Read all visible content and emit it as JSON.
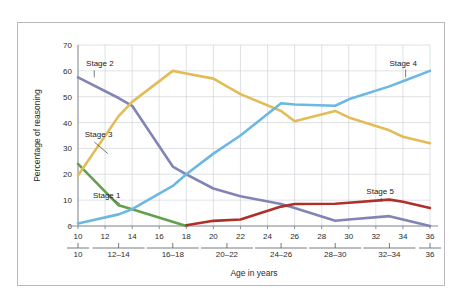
{
  "chart_data": {
    "type": "line",
    "title": "",
    "xlabel": "Age in years",
    "ylabel": "Percentage of reasoning",
    "ylim": [
      0,
      70
    ],
    "xlim": [
      10,
      36
    ],
    "grid": true,
    "legend_position": "inline-annotations",
    "y_ticks": [
      0,
      10,
      20,
      30,
      40,
      50,
      60,
      70
    ],
    "x_ticks": [
      10,
      12,
      14,
      16,
      18,
      20,
      22,
      24,
      26,
      28,
      30,
      32,
      34,
      36
    ],
    "x_group_labels": [
      "10",
      "12–14",
      "16–18",
      "20–22",
      "24–26",
      "28–30",
      "32–34",
      "36"
    ],
    "x_group_centers": [
      10,
      13,
      17,
      21,
      25,
      29,
      33,
      36
    ],
    "x": [
      10,
      13,
      14,
      17,
      18,
      20,
      22,
      25,
      26,
      29,
      30,
      33,
      34,
      36
    ],
    "series": [
      {
        "name": "Stage 1",
        "color": "#63a04a",
        "label_x": 11.1,
        "label_y": 11.0,
        "leader": [
          12.5,
          10.6,
          13.1,
          8.6
        ],
        "x": [
          10,
          13,
          14,
          18
        ],
        "values": [
          24,
          8,
          6.5,
          0
        ]
      },
      {
        "name": "Stage 2",
        "color": "#8085b5",
        "label_x": 10.6,
        "label_y": 62.0,
        "leader": [
          11.2,
          60.2,
          11.2,
          57.5
        ],
        "x": [
          10,
          13,
          14,
          17,
          18,
          20,
          22,
          25,
          26,
          29,
          30,
          33,
          34,
          36
        ],
        "values": [
          57.5,
          49.5,
          46.5,
          23,
          20,
          14.5,
          11.5,
          8.5,
          7,
          2,
          2.5,
          3.8,
          2.5,
          0
        ]
      },
      {
        "name": "Stage 3",
        "color": "#e2bc57",
        "label_x": 10.5,
        "label_y": 34.5,
        "leader": [
          11.2,
          32.5,
          12.2,
          28.0
        ],
        "x": [
          10,
          13,
          14,
          17,
          18,
          20,
          22,
          25,
          26,
          29,
          30,
          33,
          34,
          36
        ],
        "values": [
          19.5,
          42.5,
          48,
          60,
          59,
          57,
          51,
          44.5,
          40.5,
          44.5,
          42,
          37,
          34.5,
          32
        ]
      },
      {
        "name": "Stage 4",
        "color": "#6bb8e2",
        "label_x": 33.0,
        "label_y": 62.0,
        "leader": [
          34.2,
          60.5,
          34.2,
          57.5
        ],
        "x": [
          10,
          13,
          14,
          17,
          18,
          20,
          22,
          25,
          26,
          29,
          30,
          33,
          34,
          36
        ],
        "values": [
          1,
          4.5,
          6.5,
          15.5,
          20,
          28,
          35,
          47.5,
          47,
          46.5,
          49,
          54,
          56,
          60
        ]
      },
      {
        "name": "Stage 5",
        "color": "#ae3029",
        "label_x": 31.3,
        "label_y": 12.2,
        "leader": [
          32.4,
          10.9,
          32.4,
          9.4
        ],
        "x": [
          18,
          20,
          22,
          25,
          26,
          29,
          30,
          33,
          34,
          36
        ],
        "values": [
          0.3,
          2,
          2.5,
          7.5,
          8.5,
          8.6,
          9,
          10.2,
          9.4,
          7
        ]
      }
    ]
  }
}
